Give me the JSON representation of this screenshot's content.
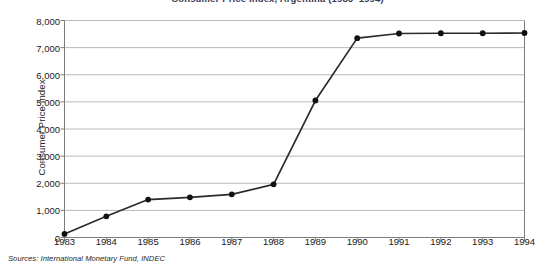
{
  "chart_data": {
    "type": "line",
    "title": "",
    "subtitle": "",
    "xlabel": "",
    "ylabel": "Consumer Price Index",
    "x": [
      1983,
      1984,
      1985,
      1986,
      1987,
      1988,
      1989,
      1990,
      1991,
      1992,
      1993,
      1994
    ],
    "categories": [
      "1983",
      "1984",
      "1985",
      "1986",
      "1987",
      "1988",
      "1989",
      "1990",
      "1991",
      "1992",
      "1993",
      "1994"
    ],
    "values": [
      130,
      780,
      1400,
      1480,
      1590,
      1960,
      5050,
      7350,
      7520,
      7530,
      7530,
      7540
    ],
    "series": [
      {
        "name": "Consumer Price Index",
        "values": [
          130,
          780,
          1400,
          1480,
          1590,
          1960,
          5050,
          7350,
          7520,
          7530,
          7530,
          7540
        ]
      }
    ],
    "xlim": [
      1983,
      1994
    ],
    "ylim": [
      0,
      8000
    ],
    "ytick_labels": [
      "0",
      "1,000",
      "2,000",
      "3,000",
      "4,000",
      "5,000",
      "6,000",
      "7,000",
      "8,000"
    ],
    "ytick_values": [
      0,
      1000,
      2000,
      3000,
      4000,
      5000,
      6000,
      7000,
      8000
    ],
    "xtick_labels": [
      "1983",
      "1984",
      "1985",
      "1986",
      "1987",
      "1988",
      "1989",
      "1990",
      "1991",
      "1992",
      "1993",
      "1994"
    ],
    "grid": "horizontal",
    "legend": "none",
    "marker": "filled-circle",
    "line_color": "#2b2b2b",
    "marker_color": "#111111",
    "grid_color": "#b9b9b9",
    "axis_color": "#7d7d7d",
    "background": "#ffffff"
  },
  "source": {
    "note": "Sources: International Monetary Fund, INDEC"
  },
  "header": {
    "title_clipped": "Consumer Price Index, Argentina (1983–1994)"
  }
}
